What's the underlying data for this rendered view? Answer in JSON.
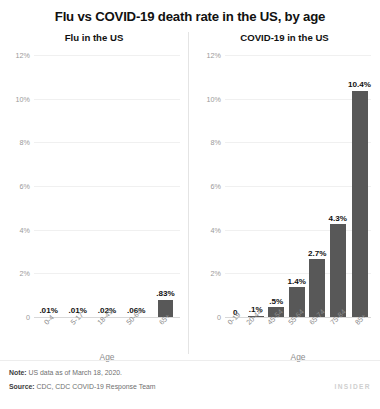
{
  "title": "Flu vs COVID-19 death rate in the US, by age",
  "footer": {
    "note_label": "Note:",
    "note_text": " US data as of March 18, 2020.",
    "source_label": "Source:",
    "source_text": " CDC, CDC COVID-19 Response Team",
    "brand": "INSIDER"
  },
  "colors": {
    "bar": "#585858",
    "tick_label": "#9a9a9a",
    "axis_label": "#8c8c8c",
    "title": "#111111"
  },
  "chart_data": [
    {
      "type": "bar",
      "title": "Flu in the US",
      "xlabel": "Age",
      "ylabel": "",
      "ylim": [
        0,
        12
      ],
      "grid": true,
      "yticks": [
        0,
        2,
        4,
        6,
        8,
        10,
        12
      ],
      "ytick_labels": [
        "0",
        "2%",
        "4%",
        "6%",
        "8%",
        "10%",
        "12%"
      ],
      "categories": [
        "0-4",
        "5-17",
        "18-49",
        "50-64",
        "65+"
      ],
      "values": [
        0.01,
        0.01,
        0.02,
        0.06,
        0.83
      ],
      "data_labels": [
        ".01%",
        ".01%",
        ".02%",
        ".06%",
        ".83%"
      ]
    },
    {
      "type": "bar",
      "title": "COVID-19 in the US",
      "xlabel": "Age",
      "ylabel": "",
      "ylim": [
        0,
        12
      ],
      "grid": true,
      "yticks": [
        0,
        2,
        4,
        6,
        8,
        10,
        12
      ],
      "ytick_labels": [
        "0",
        "2%",
        "4%",
        "6%",
        "8%",
        "10%",
        "12%"
      ],
      "categories": [
        "0-19",
        "20-44",
        "45-54",
        "55-64",
        "65-74",
        "75-84",
        "85+"
      ],
      "values": [
        0,
        0.1,
        0.5,
        1.4,
        2.7,
        4.3,
        10.4
      ],
      "data_labels": [
        "0",
        ".1%",
        ".5%",
        "1.4%",
        "2.7%",
        "4.3%",
        "10.4%"
      ]
    }
  ]
}
